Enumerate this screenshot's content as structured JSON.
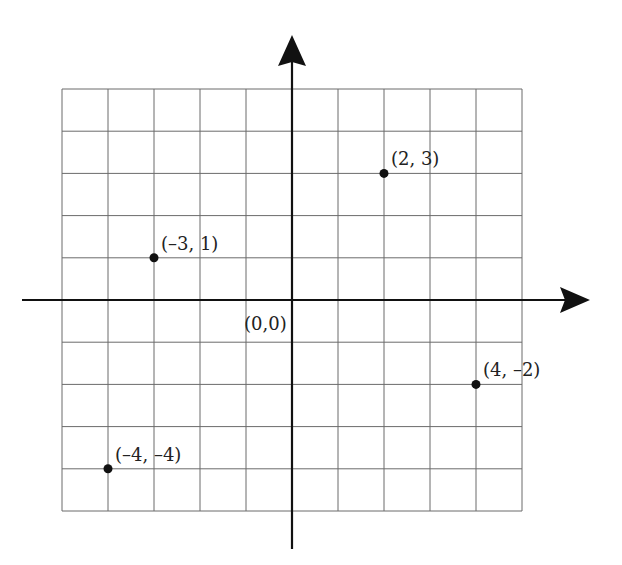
{
  "chart_data": {
    "type": "scatter",
    "title": "",
    "xlabel": "",
    "ylabel": "",
    "xlim": [
      -5,
      5
    ],
    "ylim": [
      -5,
      5
    ],
    "grid": true,
    "grid_step": 1,
    "origin_label": "(0,0)",
    "points": [
      {
        "x": -3,
        "y": 1,
        "label": "(–3, 1)"
      },
      {
        "x": 2,
        "y": 3,
        "label": "(2, 3)"
      },
      {
        "x": 4,
        "y": -2,
        "label": "(4, –2)"
      },
      {
        "x": -4,
        "y": -4,
        "label": "(–4, –4)"
      }
    ],
    "colors": {
      "grid": "#6b6b6b",
      "axes": "#111111",
      "points": "#111111",
      "text": "#222222"
    }
  }
}
